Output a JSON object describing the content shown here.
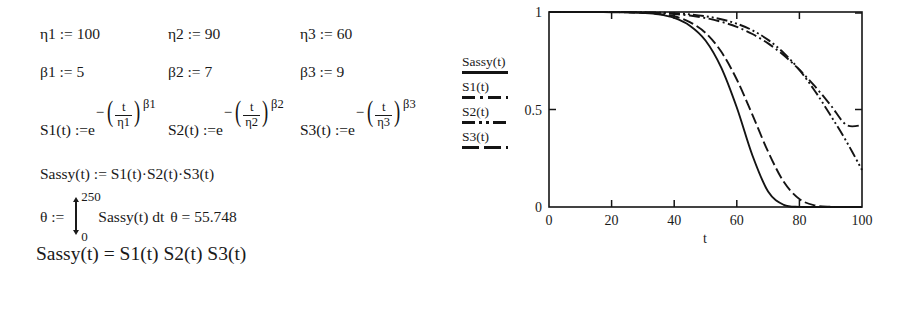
{
  "worksheet": {
    "parameters": [
      {
        "name": "η1",
        "op": ":=",
        "value": "100"
      },
      {
        "name": "η2",
        "op": ":=",
        "value": "90"
      },
      {
        "name": "η3",
        "op": ":=",
        "value": "60"
      },
      {
        "name": "β1",
        "op": ":=",
        "value": "5"
      },
      {
        "name": "β2",
        "op": ":=",
        "value": "7"
      },
      {
        "name": "β3",
        "op": ":=",
        "value": "9"
      }
    ],
    "eta": [
      {
        "label": "η1 := 100"
      },
      {
        "label": "η2 := 90"
      },
      {
        "label": "η3 := 60"
      }
    ],
    "beta": [
      {
        "label": "β1 := 5"
      },
      {
        "label": "β2 := 7"
      },
      {
        "label": "β3 := 9"
      }
    ],
    "survival_defs": [
      {
        "lhs": "S1(t) :=",
        "base": "e",
        "num": "t",
        "den": "η1",
        "exponent": "β1"
      },
      {
        "lhs": "S2(t) :=",
        "base": "e",
        "num": "t",
        "den": "η2",
        "exponent": "β2"
      },
      {
        "lhs": "S3(t) :=",
        "base": "e",
        "num": "t",
        "den": "η3",
        "exponent": "β3"
      }
    ],
    "sassy_def": "Sassy(t) := S1(t)·S2(t)·S3(t)",
    "theta": {
      "lhs": "θ :=",
      "upper_limit": "250",
      "lower_limit": "0",
      "integrand": "Sassy(t) dt",
      "result_label": "θ = 55.748"
    },
    "final_expression": "Sassy(t) = S1(t) S2(t) S3(t)"
  },
  "legend": {
    "entries": [
      {
        "label": "Sassy(t)",
        "style": "solid"
      },
      {
        "label": "S1(t)",
        "style": "dash-dot"
      },
      {
        "label": "S2(t)",
        "style": "dash-dot-dot"
      },
      {
        "label": "S3(t)",
        "style": "dashed"
      }
    ]
  },
  "chart_data": {
    "type": "line",
    "title": "",
    "xlabel": "t",
    "ylabel": "",
    "xlim": [
      0,
      100
    ],
    "ylim": [
      0,
      1
    ],
    "xticks": [
      0,
      20,
      40,
      60,
      80,
      100
    ],
    "xtick_labels": [
      "0",
      "20",
      "40",
      "60",
      "80",
      "100"
    ],
    "yticks": [
      0,
      0.5,
      1
    ],
    "ytick_labels": [
      "0",
      "0.5",
      "1"
    ],
    "grid": false,
    "legend_position": "left-outside",
    "x": [
      0,
      5,
      10,
      15,
      20,
      25,
      30,
      35,
      40,
      45,
      50,
      55,
      60,
      65,
      70,
      75,
      80,
      85,
      90,
      95,
      100
    ],
    "series": [
      {
        "name": "Sassy(t)",
        "style": "solid",
        "values": [
          1.0,
          1.0,
          1.0,
          1.0,
          0.999,
          0.998,
          0.995,
          0.988,
          0.97,
          0.93,
          0.854,
          0.716,
          0.51,
          0.264,
          0.079,
          0.011,
          0.0005,
          0.0,
          0.0,
          0.0,
          0.0
        ]
      },
      {
        "name": "S1(t)",
        "style": "dash-dot",
        "values": [
          1.0,
          1.0,
          1.0,
          1.0,
          0.9997,
          0.999,
          0.9976,
          0.9948,
          0.99,
          0.982,
          0.969,
          0.95,
          0.924,
          0.887,
          0.839,
          0.778,
          0.704,
          0.618,
          0.522,
          0.421,
          0.42
        ]
      },
      {
        "name": "S2(t)",
        "style": "dash-dot-dot",
        "values": [
          1.0,
          1.0,
          1.0,
          1.0,
          0.9999,
          0.9996,
          0.9987,
          0.9969,
          0.9936,
          0.988,
          0.978,
          0.963,
          0.94,
          0.906,
          0.857,
          0.79,
          0.703,
          0.594,
          0.469,
          0.337,
          0.19
        ]
      },
      {
        "name": "S3(t)",
        "style": "dashed",
        "values": [
          1.0,
          1.0,
          1.0,
          1.0,
          0.9995,
          0.9985,
          0.996,
          0.991,
          0.978,
          0.948,
          0.893,
          0.797,
          0.654,
          0.472,
          0.284,
          0.129,
          0.041,
          0.008,
          0.0009,
          5e-05,
          0.0
        ]
      }
    ]
  }
}
